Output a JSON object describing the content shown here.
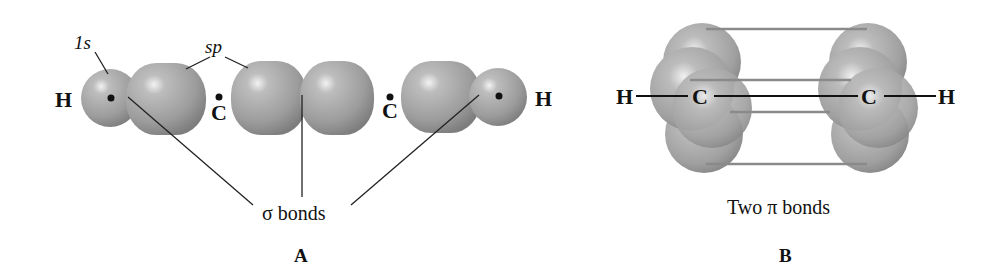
{
  "figure": {
    "panels": [
      {
        "id": "A",
        "label": "A",
        "atoms": {
          "h_left": "H",
          "c_left": "C",
          "c_right": "C",
          "h_right": "H"
        },
        "orbital_labels": {
          "one_s": "1s",
          "sp": "sp"
        },
        "bond_caption": "σ bonds"
      },
      {
        "id": "B",
        "label": "B",
        "atoms": {
          "h_left": "H",
          "c_left": "C",
          "c_right": "C",
          "h_right": "H"
        },
        "bond_caption": "Two π bonds"
      }
    ],
    "colors": {
      "orbital_fill": "#9a9a9a",
      "orbital_highlight": "#e6e6e6",
      "line": "#222222",
      "pi_line": "#8c8c8c"
    }
  }
}
